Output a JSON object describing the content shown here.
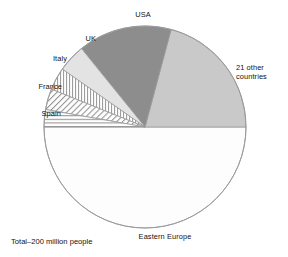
{
  "chart_data": {
    "type": "pie",
    "title": "",
    "subtitle": "",
    "footnote": "Total–200 million people",
    "legend_position": "outside-labels",
    "total_label": "200 million people",
    "center": {
      "x": 145,
      "y": 127
    },
    "radius": 101,
    "start_angle_deg": 180,
    "direction": "counterclockwise",
    "categories": [
      "Eastern Europe",
      "21 other countries",
      "USA",
      "UK",
      "Italy",
      "France",
      "Spain"
    ],
    "values": [
      50,
      21,
      15,
      4.5,
      3.5,
      3.5,
      2.5
    ],
    "unit": "percent",
    "slices": [
      {
        "label": "Eastern Europe",
        "value": 50,
        "start_deg": 180,
        "end_deg": 360,
        "fill": "#fdfdfd",
        "pattern": "solid",
        "label_x": 165,
        "label_y": 236
      },
      {
        "label": "21 other countries",
        "value": 21,
        "start_deg": 0,
        "end_deg": 75,
        "fill": "#c9c9c9",
        "pattern": "solid",
        "label_x": 261,
        "label_y": 72
      },
      {
        "label": "USA",
        "value": 15,
        "start_deg": 75,
        "end_deg": 129,
        "fill": "#8d8d8d",
        "pattern": "solid",
        "label_x": 143,
        "label_y": 14
      },
      {
        "label": "UK",
        "value": 4.5,
        "start_deg": 129,
        "end_deg": 145,
        "fill": "#e3e3e3",
        "pattern": "solid",
        "label_x": 79,
        "label_y": 38
      },
      {
        "label": "Italy",
        "value": 3.5,
        "start_deg": 145,
        "end_deg": 158,
        "fill": "#ffffff",
        "pattern": "vertical-hatch",
        "label_x": 48,
        "label_y": 58
      },
      {
        "label": "France",
        "value": 3.5,
        "start_deg": 158,
        "end_deg": 170,
        "fill": "#ffffff",
        "pattern": "diagonal-hatch",
        "label_x": 38,
        "label_y": 86
      },
      {
        "label": "Spain",
        "value": 2.5,
        "start_deg": 170,
        "end_deg": 180,
        "fill": "#ffffff",
        "pattern": "horizontal-hatch",
        "label_x": 39,
        "label_y": 113
      }
    ],
    "colors": {
      "usa": "#8d8d8d",
      "other_countries": "#c9c9c9",
      "uk": "#e3e3e3",
      "eastern_europe": "#fdfdfd",
      "outline": "#9a9a9a",
      "text": "#111111",
      "background": "#ffffff"
    }
  },
  "labels": {
    "usa": "USA",
    "other_countries": "21 other\ncountries",
    "uk": "UK",
    "italy": "Italy",
    "france": "France",
    "spain": "Spain",
    "eastern_europe": "Eastern Europe",
    "footnote": "Total–200 million people"
  }
}
